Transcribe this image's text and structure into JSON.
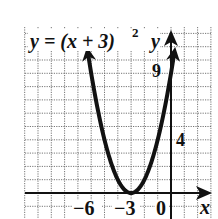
{
  "chart_data": {
    "type": "line",
    "equation": {
      "prefix": "y = (x + 3)",
      "exponent": "2"
    },
    "xlabel": "x",
    "ylabel": "y",
    "x_tick_labels": [
      "-6",
      "-3",
      "0"
    ],
    "y_tick_labels": [
      "4",
      "9"
    ],
    "xlim": [
      -11,
      3
    ],
    "ylim": [
      -2,
      12
    ],
    "grid": true,
    "series": [
      {
        "name": "y = (x + 3)^2",
        "x": [
          -6.4,
          -6,
          -5,
          -4,
          -3,
          -2,
          -1,
          0,
          0.4
        ],
        "values": [
          11.56,
          9,
          4,
          1,
          0,
          1,
          4,
          9,
          11.56
        ]
      }
    ],
    "vertex": [
      -3,
      0
    ],
    "colors": {
      "curve": "#111111",
      "grid": "#555555",
      "axes": "#111111"
    }
  },
  "labels": {
    "eq_main": "y = (x + 3)",
    "eq_exp": "2",
    "y_axis": "y",
    "x_axis": "x",
    "tick_9": "9",
    "tick_4": "4",
    "tick_m6": "−6",
    "tick_m3": "−3",
    "tick_0": "0"
  }
}
